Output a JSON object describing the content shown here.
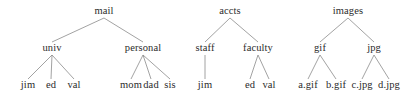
{
  "diagram": {
    "type": "tree",
    "background_color": "#ffffff",
    "text_color": "#2b2b2b",
    "edge_color": "#8a8a8a",
    "edge_width": 0.8,
    "level_y": [
      14,
      51,
      88
    ],
    "trees": [
      {
        "name": "mail-tree",
        "root": "mail",
        "root_x": 104,
        "nodes": [
          {
            "id": "mail",
            "label": "mail",
            "x": 104,
            "level": 0,
            "parent": null
          },
          {
            "id": "univ",
            "label": "univ",
            "x": 52,
            "level": 1,
            "parent": "mail"
          },
          {
            "id": "personal",
            "label": "personal",
            "x": 143,
            "level": 1,
            "parent": "mail"
          },
          {
            "id": "jim",
            "label": "jim",
            "x": 28,
            "level": 2,
            "parent": "univ"
          },
          {
            "id": "ed",
            "label": "ed",
            "x": 51,
            "level": 2,
            "parent": "univ"
          },
          {
            "id": "val",
            "label": "val",
            "x": 74,
            "level": 2,
            "parent": "univ"
          },
          {
            "id": "mom",
            "label": "mom",
            "x": 131,
            "level": 2,
            "parent": "personal"
          },
          {
            "id": "dad",
            "label": "dad",
            "x": 151,
            "level": 2,
            "parent": "personal"
          },
          {
            "id": "sis",
            "label": "sis",
            "x": 170,
            "level": 2,
            "parent": "personal"
          }
        ]
      },
      {
        "name": "accts-tree",
        "root": "accts",
        "root_x": 230,
        "nodes": [
          {
            "id": "accts",
            "label": "accts",
            "x": 230,
            "level": 0,
            "parent": null
          },
          {
            "id": "staff",
            "label": "staff",
            "x": 205,
            "level": 1,
            "parent": "accts"
          },
          {
            "id": "faculty",
            "label": "faculty",
            "x": 258,
            "level": 1,
            "parent": "accts"
          },
          {
            "id": "jim2",
            "label": "jim",
            "x": 205,
            "level": 2,
            "parent": "staff"
          },
          {
            "id": "ed2",
            "label": "ed",
            "x": 250,
            "level": 2,
            "parent": "faculty"
          },
          {
            "id": "val2",
            "label": "val",
            "x": 269,
            "level": 2,
            "parent": "faculty"
          }
        ]
      },
      {
        "name": "images-tree",
        "root": "images",
        "root_x": 348,
        "nodes": [
          {
            "id": "images",
            "label": "images",
            "x": 348,
            "level": 0,
            "parent": null
          },
          {
            "id": "gif",
            "label": "gif",
            "x": 320,
            "level": 1,
            "parent": "images"
          },
          {
            "id": "jpg",
            "label": "jpg",
            "x": 374,
            "level": 1,
            "parent": "images"
          },
          {
            "id": "a_gif",
            "label": "a.gif",
            "x": 308,
            "level": 2,
            "parent": "gif"
          },
          {
            "id": "b_gif",
            "label": "b.gif",
            "x": 336,
            "level": 2,
            "parent": "gif"
          },
          {
            "id": "c_jpg",
            "label": "c.jpg",
            "x": 362,
            "level": 2,
            "parent": "jpg"
          },
          {
            "id": "d_jpg",
            "label": "d.jpg",
            "x": 389,
            "level": 2,
            "parent": "jpg"
          }
        ]
      }
    ]
  }
}
